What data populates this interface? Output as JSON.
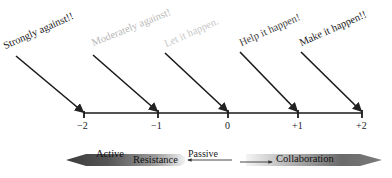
{
  "diagram": {
    "type": "scale-of-stakeholder-attitudes",
    "scale": {
      "ticks": [
        {
          "value": "−2",
          "x": 84
        },
        {
          "value": "−1",
          "x": 158
        },
        {
          "value": "0",
          "x": 228
        },
        {
          "value": "+1",
          "x": 298
        },
        {
          "value": "+2",
          "x": 362
        }
      ]
    },
    "positions": [
      {
        "label": "Strongly against!!",
        "color": "#1a1a1a",
        "tick": "−2"
      },
      {
        "label": "Moderately against!",
        "color": "#b8b8b8",
        "tick": "−1"
      },
      {
        "label": "Let it happen.",
        "color": "#c8c8c8",
        "tick": "0"
      },
      {
        "label": "Help it happen!",
        "color": "#444444",
        "tick": "+1"
      },
      {
        "label": "Make it happen!!",
        "color": "#222222",
        "tick": "+2"
      }
    ],
    "spectrum_bar": {
      "left_labels": [
        "Active",
        "Resistance"
      ],
      "middle_label": "Passive",
      "right_label": "Collaboration",
      "left_color": "#4a4a4a",
      "right_color": "#5a5a5a"
    }
  }
}
